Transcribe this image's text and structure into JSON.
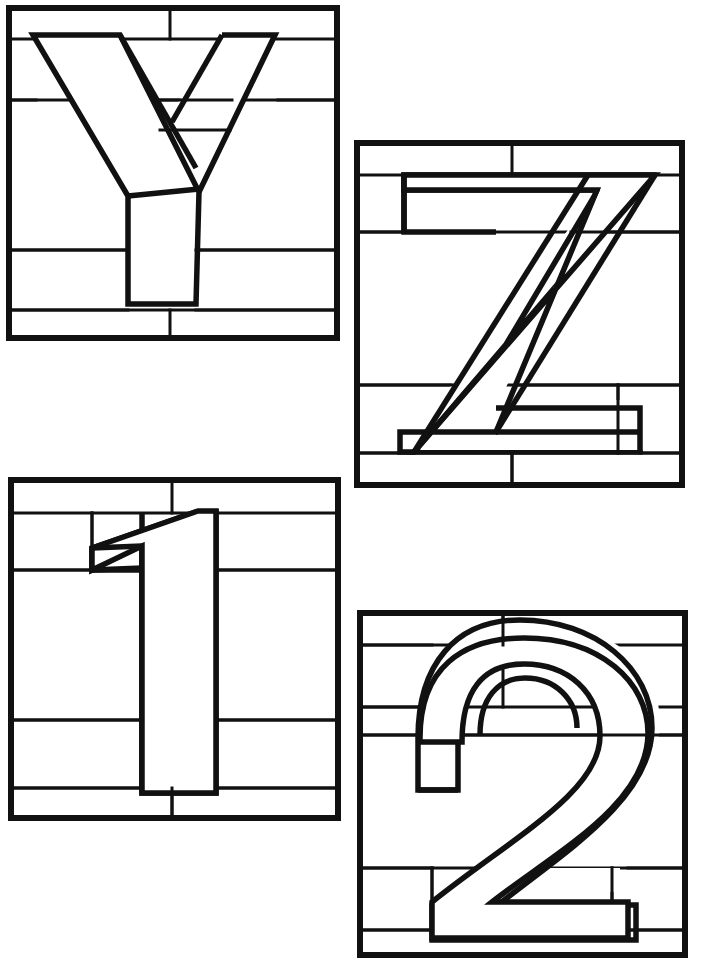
{
  "document": {
    "title": "Mosaic Alphabet Panels",
    "description": "Four black-and-white line-art mosaic panels, each showing a large block glyph overlaid on a grid of rectangular background panes.",
    "background_color": "#ffffff",
    "line_color": "#111111",
    "canvas": {
      "width": 705,
      "height": 970
    }
  },
  "panels": [
    {
      "id": "panel-y",
      "glyph": "Y",
      "glyph_kind": "letter",
      "position": "top-left",
      "frame": {
        "x": 9,
        "y": 8,
        "width": 328,
        "height": 330
      },
      "background_rows": 5,
      "stroke_weights": {
        "border": 6,
        "grid": 3,
        "glyph": 5
      }
    },
    {
      "id": "panel-z",
      "glyph": "Z",
      "glyph_kind": "letter",
      "position": "top-right",
      "frame": {
        "x": 357,
        "y": 143,
        "width": 325,
        "height": 342
      },
      "background_rows": 5,
      "stroke_weights": {
        "border": 6,
        "grid": 3,
        "glyph": 5
      }
    },
    {
      "id": "panel-one",
      "glyph": "1",
      "glyph_kind": "numeral",
      "position": "bottom-left",
      "frame": {
        "x": 11,
        "y": 480,
        "width": 327,
        "height": 338
      },
      "background_rows": 5,
      "stroke_weights": {
        "border": 6,
        "grid": 3,
        "glyph": 5
      }
    },
    {
      "id": "panel-two",
      "glyph": "2",
      "glyph_kind": "numeral",
      "position": "bottom-right",
      "frame": {
        "x": 360,
        "y": 613,
        "width": 325,
        "height": 342
      },
      "background_rows": 6,
      "stroke_weights": {
        "border": 6,
        "grid": 3,
        "glyph": 5
      }
    }
  ],
  "legend": {
    "sheet_label": "",
    "note": ""
  }
}
